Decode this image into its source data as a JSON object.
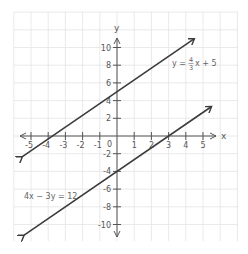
{
  "chart_data": {
    "type": "line",
    "title": "",
    "xlabel": "x",
    "ylabel": "y",
    "xlim": [
      -5.5,
      5.5
    ],
    "ylim": [
      -11,
      11
    ],
    "grid": true,
    "x_ticks": [
      -5,
      -4,
      -3,
      -2,
      -1,
      1,
      2,
      3,
      4,
      5
    ],
    "y_ticks": [
      10,
      8,
      6,
      4,
      2,
      -2,
      -4,
      -6,
      -8,
      -10
    ],
    "origin_label": "0",
    "series": [
      {
        "name": "y = 4/3x + 5",
        "label_text": "y = ",
        "label_frac_num": "4",
        "label_frac_den": "3",
        "label_rest": "x + 5",
        "slope": 1.3333,
        "intercept": 5,
        "x": [
          -5.5,
          -3.75,
          0,
          4.5
        ],
        "y": [
          -2.33,
          0,
          5,
          11
        ],
        "arrows": "both"
      },
      {
        "name": "4x - 3y = 12",
        "label_text": "4x − 3y = 12",
        "slope": 1.3333,
        "intercept": -4,
        "x": [
          -5.4,
          0,
          3,
          5.5
        ],
        "y": [
          -11.2,
          -4,
          0,
          3.33
        ],
        "arrows": "both"
      }
    ],
    "colors": {
      "line": "#3c3c3c",
      "axis": "#555555",
      "grid": "#e4e4e4"
    }
  },
  "labels": {
    "x_axis": "x",
    "y_axis": "y",
    "origin": "0",
    "x_ticks": [
      "-5",
      "-4",
      "-3",
      "-2",
      "-1",
      "1",
      "2",
      "3",
      "4",
      "5"
    ],
    "y_ticks": [
      "10",
      "8",
      "6",
      "4",
      "2",
      "-2",
      "-4",
      "-6",
      "-8",
      "-10"
    ],
    "eq1_prefix": "y = ",
    "eq1_num": "4",
    "eq1_den": "3",
    "eq1_suffix": "x + 5",
    "eq2": "4x − 3y = 12"
  }
}
